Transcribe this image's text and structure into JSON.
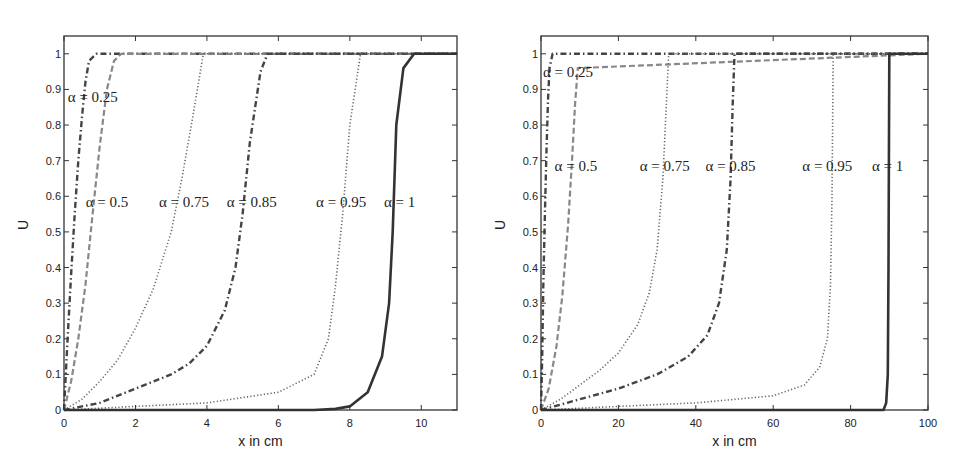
{
  "chart_data": [
    {
      "type": "line",
      "title": "",
      "xlabel": "x in cm",
      "ylabel": "U",
      "xlim": [
        0,
        11
      ],
      "ylim": [
        0,
        1.05
      ],
      "xticks": [
        "0",
        "2",
        "4",
        "6",
        "8",
        "10"
      ],
      "yticks": [
        "0",
        "0.1",
        "0.2",
        "0.3",
        "0.4",
        "0.5",
        "0.6",
        "0.7",
        "0.8",
        "0.9",
        "1"
      ],
      "grid": false,
      "legend": "inline annotations",
      "series": [
        {
          "name": "α = 0.25",
          "style": "dash-dot",
          "x": [
            0,
            0.05,
            0.1,
            0.2,
            0.3,
            0.4,
            0.5,
            0.6,
            0.7,
            0.9,
            11
          ],
          "y": [
            0,
            0.1,
            0.2,
            0.38,
            0.55,
            0.7,
            0.82,
            0.92,
            0.98,
            1,
            1
          ]
        },
        {
          "name": "α = 0.5",
          "style": "dashed",
          "x": [
            0,
            0.2,
            0.4,
            0.6,
            0.8,
            1.0,
            1.2,
            1.4,
            1.6,
            11
          ],
          "y": [
            0,
            0.08,
            0.2,
            0.35,
            0.55,
            0.74,
            0.9,
            0.98,
            1,
            1
          ]
        },
        {
          "name": "α = 0.75",
          "style": "dotted",
          "x": [
            0,
            0.5,
            1,
            1.5,
            2,
            2.5,
            3,
            3.3,
            3.6,
            3.9,
            11
          ],
          "y": [
            0,
            0.03,
            0.08,
            0.14,
            0.23,
            0.34,
            0.5,
            0.65,
            0.82,
            1,
            1
          ]
        },
        {
          "name": "α = 0.85",
          "style": "dash-dot",
          "x": [
            0,
            1,
            2,
            3,
            3.5,
            4,
            4.5,
            4.8,
            5.0,
            5.2,
            5.5,
            5.7,
            11
          ],
          "y": [
            0,
            0.02,
            0.06,
            0.1,
            0.13,
            0.18,
            0.28,
            0.4,
            0.55,
            0.75,
            0.95,
            1,
            1
          ]
        },
        {
          "name": "α = 0.95",
          "style": "dotted",
          "x": [
            0,
            2,
            4,
            6,
            7,
            7.4,
            7.6,
            7.8,
            8.0,
            8.3,
            11
          ],
          "y": [
            0,
            0.01,
            0.02,
            0.05,
            0.1,
            0.2,
            0.35,
            0.55,
            0.8,
            1,
            1
          ]
        },
        {
          "name": "α = 1",
          "style": "solid",
          "x": [
            0,
            6,
            7,
            7.6,
            8,
            8.5,
            8.9,
            9.1,
            9.2,
            9.3,
            9.5,
            9.8,
            11
          ],
          "y": [
            0,
            0,
            0,
            0.003,
            0.01,
            0.05,
            0.15,
            0.3,
            0.5,
            0.8,
            0.96,
            1,
            1
          ]
        }
      ],
      "annotations": [
        {
          "text": "α = 0.25",
          "x": 0.05,
          "y": 0.88
        },
        {
          "text": "α = 0.5",
          "x": 0.55,
          "y": 0.585
        },
        {
          "text": "α = 0.75",
          "x": 2.6,
          "y": 0.585
        },
        {
          "text": "α = 0.85",
          "x": 4.5,
          "y": 0.585
        },
        {
          "text": "α = 0.95",
          "x": 7.0,
          "y": 0.585
        },
        {
          "text": "α = 1",
          "x": 8.9,
          "y": 0.585
        }
      ]
    },
    {
      "type": "line",
      "title": "",
      "xlabel": "x in cm",
      "ylabel": "U",
      "xlim": [
        0,
        100
      ],
      "ylim": [
        0,
        1.05
      ],
      "xticks": [
        "0",
        "20",
        "40",
        "60",
        "80",
        "100"
      ],
      "yticks": [
        "0",
        "0.1",
        "0.2",
        "0.3",
        "0.4",
        "0.5",
        "0.6",
        "0.7",
        "0.8",
        "0.9",
        "1"
      ],
      "grid": false,
      "legend": "inline annotations",
      "series": [
        {
          "name": "α = 0.25",
          "style": "dash-dot",
          "x": [
            0,
            0.3,
            0.6,
            1,
            1.4,
            1.8,
            2.2,
            3,
            100
          ],
          "y": [
            0,
            0.15,
            0.35,
            0.55,
            0.72,
            0.87,
            0.96,
            1,
            100
          ]
        },
        {
          "name": "α = 0.5",
          "style": "dashed",
          "x": [
            0,
            2,
            4,
            5.5,
            7,
            8,
            8.8,
            9.5,
            100
          ],
          "y": [
            0,
            0.06,
            0.18,
            0.32,
            0.52,
            0.7,
            0.86,
            0.96,
            1
          ]
        },
        {
          "name": "α = 0.75",
          "style": "dotted",
          "x": [
            0,
            5,
            10,
            15,
            20,
            25,
            28,
            30,
            31.5,
            33,
            100
          ],
          "y": [
            0,
            0.03,
            0.07,
            0.11,
            0.16,
            0.24,
            0.33,
            0.45,
            0.65,
            1,
            1
          ]
        },
        {
          "name": "α = 0.85",
          "style": "dash-dot",
          "x": [
            0,
            10,
            20,
            30,
            38,
            43,
            46,
            48,
            49,
            49.5,
            50,
            100
          ],
          "y": [
            0,
            0.03,
            0.06,
            0.1,
            0.15,
            0.21,
            0.3,
            0.45,
            0.65,
            0.85,
            1,
            1
          ]
        },
        {
          "name": "α = 0.95",
          "style": "dotted",
          "x": [
            0,
            20,
            40,
            60,
            68,
            72,
            74,
            74.8,
            75.2,
            75.5,
            100
          ],
          "y": [
            0,
            0.01,
            0.02,
            0.04,
            0.07,
            0.12,
            0.2,
            0.35,
            0.6,
            1,
            1
          ]
        },
        {
          "name": "α = 1",
          "style": "solid",
          "x": [
            0,
            88.5,
            89.2,
            89.6,
            89.8,
            90,
            100
          ],
          "y": [
            0,
            0,
            0.02,
            0.1,
            0.4,
            1,
            1
          ]
        }
      ],
      "annotations": [
        {
          "text": "α = 0.25",
          "x": 0,
          "y": 0.95
        },
        {
          "text": "α = 0.5",
          "x": 3,
          "y": 0.685
        },
        {
          "text": "α = 0.75",
          "x": 25,
          "y": 0.685
        },
        {
          "text": "α = 0.85",
          "x": 42,
          "y": 0.685
        },
        {
          "text": "α = 0.95",
          "x": 67,
          "y": 0.685
        },
        {
          "text": "α = 1",
          "x": 85,
          "y": 0.685
        }
      ]
    }
  ],
  "figure": {
    "left_panel": {
      "xlabel": "x in cm",
      "ylabel": "U"
    },
    "right_panel": {
      "xlabel": "x in cm",
      "ylabel": "U"
    }
  }
}
